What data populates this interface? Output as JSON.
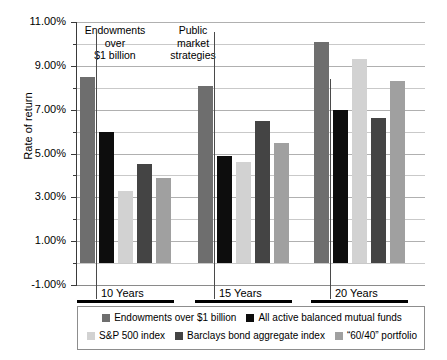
{
  "chart_data": {
    "type": "bar",
    "title": "",
    "xlabel": "",
    "ylabel": "Rate of return",
    "ylim": [
      -1.0,
      11.0
    ],
    "ytick_step": 2.0,
    "minor_tick_step": 1.0,
    "grid": true,
    "legend_position": "bottom",
    "value_suffix": "%",
    "categories": [
      "10 Years",
      "15 Years",
      "20 Years"
    ],
    "yticks": [
      {
        "value": 11.0,
        "label": "11.00%"
      },
      {
        "value": 9.0,
        "label": "9.00%"
      },
      {
        "value": 7.0,
        "label": "7.00%"
      },
      {
        "value": 5.0,
        "label": "5.00%"
      },
      {
        "value": 3.0,
        "label": "3.00%"
      },
      {
        "value": 1.0,
        "label": "1.00%"
      },
      {
        "value": -1.0,
        "label": "-1.00%"
      }
    ],
    "minor_gridlines": [
      10.0,
      8.0,
      6.0,
      4.0,
      2.0,
      0.0
    ],
    "series": [
      {
        "name": "Endowments over $1 billion",
        "color": "#6e6e6e",
        "values": [
          8.5,
          8.1,
          10.1
        ]
      },
      {
        "name": "All active balanced mutual funds",
        "color": "#0d0d0d",
        "values": [
          6.0,
          4.9,
          7.0
        ]
      },
      {
        "name": "S&P 500 index",
        "color": "#d2d2d2",
        "values": [
          3.3,
          4.6,
          9.3
        ]
      },
      {
        "name": "Barclays bond aggregate index",
        "color": "#444444",
        "values": [
          4.5,
          6.5,
          6.6
        ]
      },
      {
        "name": "“60/40” portfolio",
        "color": "#a0a0a0",
        "values": [
          3.9,
          5.5,
          8.3
        ]
      }
    ],
    "annotations": [
      {
        "id": "endowments-note",
        "lines": "Endowments\nover\n$1 billion"
      },
      {
        "id": "public-markets-note",
        "lines": "Public\nmarket\nstrategies"
      }
    ]
  },
  "annotations": {
    "endowments": {
      "line1": "Endowments",
      "line2": "over",
      "line3": "$1 billion"
    },
    "public_markets": {
      "line1": "Public",
      "line2": "market",
      "line3": "strategies"
    }
  },
  "axis": {
    "y_title": "Rate of return",
    "y_labels": [
      "11.00%",
      "9.00%",
      "7.00%",
      "5.00%",
      "3.00%",
      "1.00%",
      "-1.00%"
    ],
    "x_labels": [
      "10 Years",
      "15 Years",
      "20 Years"
    ]
  },
  "legend": {
    "row1": [
      {
        "label": "Endowments over $1 billion",
        "color": "#6e6e6e"
      },
      {
        "label": "All active balanced mutual funds",
        "color": "#0d0d0d"
      }
    ],
    "row2": [
      {
        "label": "S&P 500 index",
        "color": "#d2d2d2"
      },
      {
        "label": "Barclays bond aggregate index",
        "color": "#444444"
      },
      {
        "label": "“60/40” portfolio",
        "color": "#a0a0a0"
      }
    ]
  }
}
